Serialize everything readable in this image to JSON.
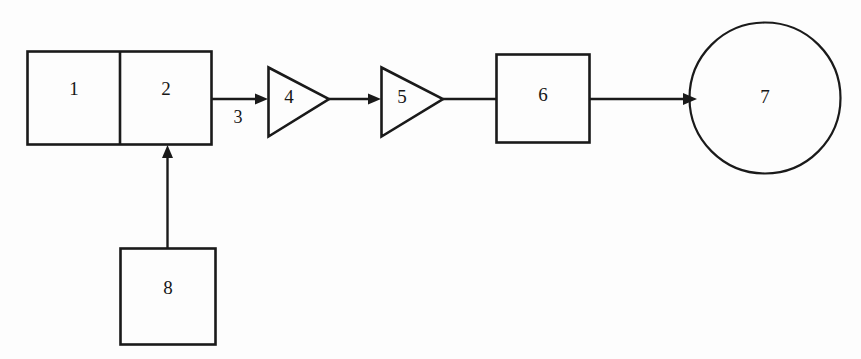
{
  "diagram": {
    "background_color": "#fdfdfd",
    "stroke_color": "#1a1a1a",
    "nodes": [
      {
        "id": "1",
        "label": "1",
        "shape": "rectangle-left-half"
      },
      {
        "id": "2",
        "label": "2",
        "shape": "rectangle-right-half"
      },
      {
        "id": "4",
        "label": "4",
        "shape": "triangle-right"
      },
      {
        "id": "5",
        "label": "5",
        "shape": "triangle-right"
      },
      {
        "id": "6",
        "label": "6",
        "shape": "rectangle"
      },
      {
        "id": "7",
        "label": "7",
        "shape": "circle"
      },
      {
        "id": "8",
        "label": "8",
        "shape": "rectangle"
      }
    ],
    "edges": [
      {
        "id": "e3",
        "label": "3",
        "from": "2",
        "to": "4",
        "direction": "right"
      },
      {
        "id": "e45",
        "label": "",
        "from": "4",
        "to": "5",
        "direction": "right"
      },
      {
        "id": "e56",
        "label": "",
        "from": "5",
        "to": "6",
        "direction": "right"
      },
      {
        "id": "e67",
        "label": "",
        "from": "6",
        "to": "7",
        "direction": "right"
      },
      {
        "id": "e82",
        "label": "",
        "from": "8",
        "to": "2",
        "direction": "up"
      }
    ]
  },
  "labels": {
    "n1": "1",
    "n2": "2",
    "e3": "3",
    "n4": "4",
    "n5": "5",
    "n6": "6",
    "n7": "7",
    "n8": "8"
  }
}
